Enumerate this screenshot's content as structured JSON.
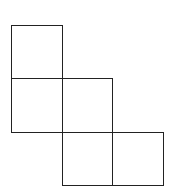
{
  "diagram": {
    "title": "",
    "stroke_color": "#222222",
    "background": "#ffffff",
    "grid": {
      "origin_x": 11,
      "origin_y": 25,
      "cell_width": 50.5,
      "cell_height": 53.3
    },
    "squares": [
      {
        "col": 0,
        "row": 0
      },
      {
        "col": 0,
        "row": 1
      },
      {
        "col": 1,
        "row": 1
      },
      {
        "col": 1,
        "row": 2
      },
      {
        "col": 2,
        "row": 2
      }
    ]
  }
}
